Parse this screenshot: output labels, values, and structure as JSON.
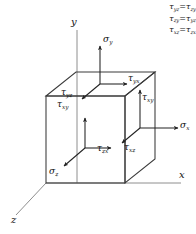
{
  "figure": {
    "axes": [
      {
        "name": "y-axis",
        "label": "y"
      },
      {
        "name": "x-axis",
        "label": "x"
      },
      {
        "name": "z-axis",
        "label": "z"
      }
    ],
    "legend": {
      "equations": [
        {
          "lhs_sym": "τ",
          "lhs_sub": "yz",
          "op": "=",
          "rhs_sym": "τ",
          "rhs_sub": "zy"
        },
        {
          "lhs_sym": "τ",
          "lhs_sub": "zy",
          "op": "=",
          "rhs_sym": "τ",
          "rhs_sub": "yz"
        },
        {
          "lhs_sym": "τ",
          "lhs_sub": "xz",
          "op": "=",
          "rhs_sym": "τ",
          "rhs_sub": "zx"
        }
      ]
    },
    "normal_stresses": [
      {
        "name": "sigma-y",
        "sym": "σ",
        "sub": "y",
        "face": "top",
        "direction": "up"
      },
      {
        "name": "sigma-x",
        "sym": "σ",
        "sub": "x",
        "face": "right",
        "direction": "right"
      },
      {
        "name": "sigma-z",
        "sym": "σ",
        "sub": "z",
        "face": "front",
        "direction": "down-left"
      }
    ],
    "shear_stresses": [
      {
        "name": "tau-yx",
        "sym": "τ",
        "sub": "yx",
        "face": "top",
        "direction": "right"
      },
      {
        "name": "tau-yz",
        "sym": "τ",
        "sub": "yz",
        "face": "top",
        "direction": "down-left"
      },
      {
        "name": "tau-xy",
        "sym": "τ",
        "sub": "xy",
        "face": "right",
        "direction": "up"
      },
      {
        "name": "tau-xz",
        "sym": "τ",
        "sub": "xz",
        "face": "right",
        "direction": "down-left"
      },
      {
        "name": "tau-zx",
        "sym": "τ",
        "sub": "zx",
        "face": "front",
        "direction": "right"
      },
      {
        "name": "tau-zy",
        "sym": "τ",
        "sub": "xy",
        "face": "front",
        "direction": "up"
      }
    ],
    "colors": {
      "stroke": "#333333",
      "axis": "#8c8c8c",
      "text": "#111111",
      "background": "#ffffff"
    }
  }
}
